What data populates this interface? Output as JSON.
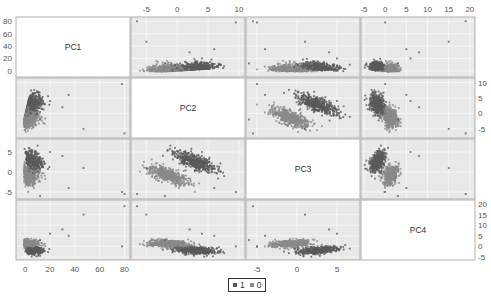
{
  "chart_data": {
    "type": "scatter",
    "title": "",
    "matrix_type": "scatterplot-matrix",
    "variables": [
      "PC1",
      "PC2",
      "PC3",
      "PC4"
    ],
    "ranges": {
      "PC1": [
        -5,
        82
      ],
      "PC2": [
        -7,
        10.5
      ],
      "PC3": [
        -6,
        7.5
      ],
      "PC4": [
        -5,
        20.5
      ]
    },
    "ticks": {
      "PC1": [
        0,
        20,
        40,
        60,
        80
      ],
      "PC2": [
        -5,
        0,
        5,
        10
      ],
      "PC3": [
        -5,
        0,
        5
      ],
      "PC4": [
        -5,
        0,
        5,
        10,
        15,
        20
      ]
    },
    "tick_labels": {
      "PC1": [
        "0",
        "20",
        "40",
        "60",
        "80"
      ],
      "PC2": [
        "-5",
        "0",
        "5",
        "10"
      ],
      "PC3": [
        "-5",
        "0",
        "5"
      ],
      "PC4": [
        "-5",
        "0",
        "5",
        "10",
        "15",
        "20"
      ]
    },
    "axis_placement": {
      "top": [
        "PC2",
        "PC4"
      ],
      "bottom": [
        "PC1",
        "PC3"
      ],
      "left": [
        "PC1",
        "PC3"
      ],
      "right": [
        "PC2",
        "PC4"
      ]
    },
    "grid": true,
    "legend": {
      "position": "bottom-center",
      "entries": [
        "1",
        "0"
      ]
    },
    "series": [
      {
        "name": "1",
        "color": "#5a5a5a"
      },
      {
        "name": "0",
        "color": "#8a8a8a"
      }
    ],
    "clusters": [
      {
        "x": "PC1",
        "y": "PC2",
        "desc": "dense cluster near PC1 0-10, PC2 -5..7; outliers to PC1 ~80"
      },
      {
        "x": "PC1",
        "y": "PC3",
        "desc": "cluster near PC1 0-15, PC3 -5..6"
      },
      {
        "x": "PC1",
        "y": "PC4",
        "desc": "two bands near PC4 0 and 3, PC1 0-30"
      },
      {
        "x": "PC2",
        "y": "PC3",
        "desc": "two parallel diagonal bands, negative slope"
      },
      {
        "x": "PC2",
        "y": "PC4",
        "desc": "two horizontal bands near PC4 -2 and 2"
      },
      {
        "x": "PC3",
        "y": "PC4",
        "desc": "two bands, positive slope"
      }
    ]
  },
  "panels": {
    "diag_labels": [
      "PC1",
      "PC2",
      "PC3",
      "PC4"
    ]
  },
  "legend": {
    "items": [
      {
        "label": "1",
        "color": "#5a5a5a"
      },
      {
        "label": "0",
        "color": "#8a8a8a"
      }
    ]
  },
  "colors": {
    "panel_bg": "#e8e8e8",
    "diag_bg": "#ffffff",
    "grid": "#f6f6f6",
    "border": "#b0b0b0",
    "point": "#555555"
  }
}
